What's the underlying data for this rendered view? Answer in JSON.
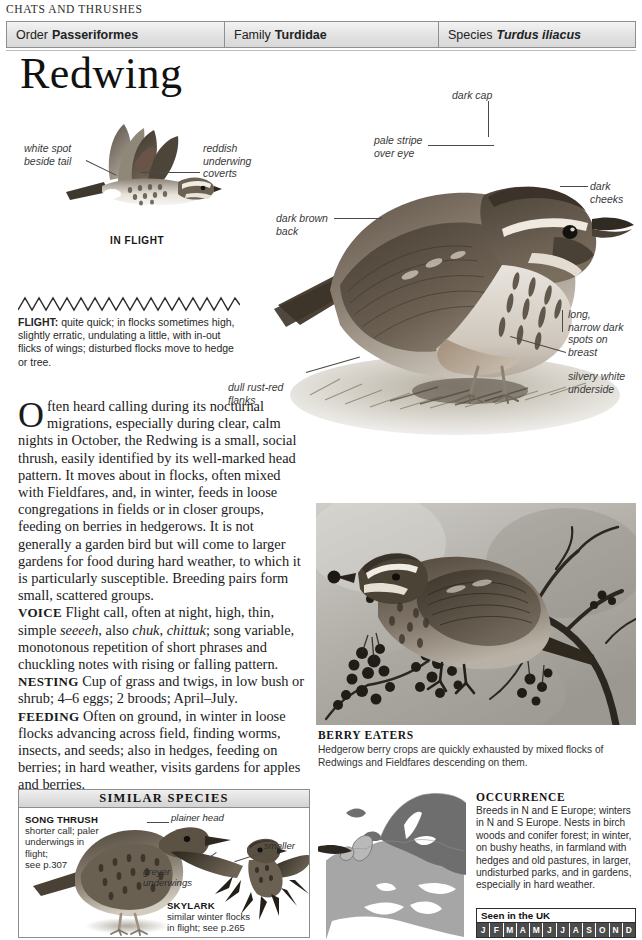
{
  "running_head": "CHATS AND THRUSHES",
  "taxonomy": {
    "order_label": "Order",
    "order_value": "Passeriformes",
    "family_label": "Family",
    "family_value": "Turdidae",
    "species_label": "Species",
    "species_value": "Turdus iliacus"
  },
  "title": "Redwing",
  "inflight": {
    "caption": "IN FLIGHT",
    "label_white_spot": "white spot\nbeside tail",
    "label_reddish": "reddish\nunderwing\ncoverts"
  },
  "photo_labels": {
    "dark_cap": "dark cap",
    "pale_stripe": "pale stripe\nover eye",
    "dark_cheeks": "dark\ncheeks",
    "dark_brown_back": "dark brown\nback",
    "breast_spots": "long,\nnarrow dark\nspots on\nbreast",
    "silvery_underside": "silvery white\nunderside",
    "rust_flanks": "dull rust-red\nflanks"
  },
  "flight": {
    "heading": "FLIGHT:",
    "text": " quite quick; in flocks sometimes high, slightly erratic, undulating a little, with in-out flicks of wings; disturbed flocks move to hedge or tree."
  },
  "body": {
    "dropcap": "O",
    "intro": "ften heard calling during its nocturnal migrations, especially during clear, calm nights in October, the Redwing is a small, social thrush, easily identified by its well-marked head pattern. It moves about in flocks, often mixed with Fieldfares, and, in winter, feeds in loose congregations in fields or in closer groups, feeding on berries in hedgerows. It is not generally a garden bird but will come to larger gardens for food during hard weather, to which it is particularly susceptible. Breeding pairs form small, scattered groups.",
    "voice_heading": "VOICE",
    "voice_text_1": " Flight call, often at night, high, thin, simple ",
    "voice_italic_1": "seeeeh",
    "voice_text_2": ", also ",
    "voice_italic_2": "chuk",
    "voice_text_3": ", ",
    "voice_italic_3": "chittuk",
    "voice_text_4": "; song variable, monotonous repetition of short phrases and chuckling notes with rising or falling pattern.",
    "nesting_heading": "NESTING",
    "nesting_text": " Cup of grass and twigs, in low bush or shrub; 4–6 eggs; 2 broods; April–July.",
    "feeding_heading": "FEEDING",
    "feeding_text": " Often on ground, in winter in loose flocks advancing across field, finding worms, insects, and seeds; also in hedges, feeding on berries; in hard weather, visits gardens for apples and berries."
  },
  "berry_caption": {
    "title": "BERRY EATERS",
    "text": "Hedgerow berry crops are quickly exhausted by mixed flocks of Redwings and Fieldfares descending on them."
  },
  "similar_species": {
    "heading": "SIMILAR SPECIES",
    "song_thrush_name": "SONG THRUSH",
    "song_thrush_desc": "shorter call; paler\nunderwings in\nflight;\nsee p.307",
    "plainer_head": "plainer head",
    "smaller": "smaller",
    "greyer_underwings": "greyer\nunderwings",
    "skylark_name": "SKYLARK",
    "skylark_desc": "similar winter flocks\nin flight; see p.265"
  },
  "occurrence": {
    "title": "OCCURRENCE",
    "text": "Breeds in N and E Europe; winters in N and S Europe. Nests in birch woods and conifer forest; in winter, on bushy heaths, in farmland with hedges and old pastures, in larger, undisturbed parks, and in gardens, especially in hard weather.",
    "seen_title": "Seen in the UK",
    "months": [
      "J",
      "F",
      "M",
      "A",
      "M",
      "J",
      "J",
      "A",
      "S",
      "O",
      "N",
      "D"
    ],
    "months_active": [
      true,
      true,
      true,
      true,
      true,
      true,
      true,
      true,
      true,
      true,
      true,
      true
    ]
  },
  "colors": {
    "bar_border": "#8f8f8f",
    "bar_fill": "#e2e2e2",
    "text": "#1b1b1b",
    "annotation": "#3a3a3a",
    "map_breeding": "#6d6d6d",
    "map_wintering": "#a8a8a8",
    "month_active": "#4c4c4c"
  }
}
